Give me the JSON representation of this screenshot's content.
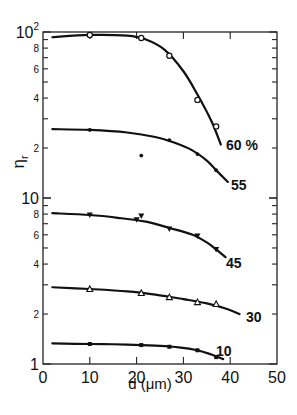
{
  "chart_data": {
    "type": "line",
    "title": "",
    "xlabel": "d (μm)",
    "ylabel": "ηr",
    "xlim": [
      0,
      50
    ],
    "ylim": [
      1,
      100
    ],
    "yscale": "log",
    "grid": false,
    "legend": "inline labels at curve ends",
    "x_ticks": [
      0,
      10,
      20,
      30,
      40,
      50
    ],
    "y_tick_labels": [
      {
        "value": 1,
        "label": "1"
      },
      {
        "value": 2,
        "label": "2"
      },
      {
        "value": 4,
        "label": "4"
      },
      {
        "value": 6,
        "label": "6"
      },
      {
        "value": 8,
        "label": "8"
      },
      {
        "value": 10,
        "label": "10"
      },
      {
        "value": 20,
        "label": "2"
      },
      {
        "value": 40,
        "label": "4"
      },
      {
        "value": 60,
        "label": "6"
      },
      {
        "value": 80,
        "label": "8"
      },
      {
        "value": 100,
        "label": "10²"
      }
    ],
    "series": [
      {
        "name": "60 %",
        "marker": "open-circle",
        "points": [
          [
            10,
            96
          ],
          [
            21,
            92
          ],
          [
            27,
            72
          ],
          [
            33,
            39
          ],
          [
            37,
            27
          ]
        ],
        "curve": [
          [
            2,
            93
          ],
          [
            10,
            96
          ],
          [
            18,
            95
          ],
          [
            22,
            90
          ],
          [
            26,
            78
          ],
          [
            30,
            58
          ],
          [
            33,
            42
          ],
          [
            36,
            29
          ],
          [
            38,
            21
          ]
        ]
      },
      {
        "name": "55",
        "marker": "filled-circle",
        "points": [
          [
            10,
            25.7
          ],
          [
            21,
            18
          ],
          [
            27,
            22.3
          ],
          [
            33,
            18.4
          ],
          [
            37,
            14.7
          ]
        ],
        "curve": [
          [
            2,
            26
          ],
          [
            10,
            25.7
          ],
          [
            18,
            24.8
          ],
          [
            24,
            23.3
          ],
          [
            28,
            21.6
          ],
          [
            32,
            19.3
          ],
          [
            35,
            16.8
          ],
          [
            37,
            14.7
          ],
          [
            39.5,
            12.5
          ]
        ]
      },
      {
        "name": "45",
        "marker": "filled-down-triangle",
        "points": [
          [
            10,
            7.9
          ],
          [
            21,
            7.8
          ],
          [
            20,
            7.4
          ],
          [
            27,
            6.5
          ],
          [
            33,
            5.9
          ],
          [
            37,
            4.9
          ]
        ],
        "curve": [
          [
            2,
            8.1
          ],
          [
            10,
            7.9
          ],
          [
            16,
            7.6
          ],
          [
            22,
            7.2
          ],
          [
            27,
            6.6
          ],
          [
            32,
            6.0
          ],
          [
            35,
            5.4
          ],
          [
            37,
            4.9
          ],
          [
            39,
            4.4
          ]
        ]
      },
      {
        "name": "30",
        "marker": "open-triangle",
        "points": [
          [
            10,
            2.83
          ],
          [
            21,
            2.68
          ],
          [
            27,
            2.53
          ],
          [
            33,
            2.36
          ],
          [
            37,
            2.3
          ]
        ],
        "curve": [
          [
            2,
            2.9
          ],
          [
            10,
            2.83
          ],
          [
            18,
            2.74
          ],
          [
            24,
            2.62
          ],
          [
            30,
            2.46
          ],
          [
            35,
            2.32
          ],
          [
            39,
            2.16
          ],
          [
            42,
            2.0
          ]
        ]
      },
      {
        "name": "10",
        "marker": "filled-square",
        "points": [
          [
            10,
            1.32
          ],
          [
            21,
            1.3
          ],
          [
            27,
            1.27
          ],
          [
            33,
            1.21
          ],
          [
            37,
            1.1
          ]
        ],
        "curve": [
          [
            2,
            1.33
          ],
          [
            10,
            1.32
          ],
          [
            18,
            1.31
          ],
          [
            24,
            1.29
          ],
          [
            29,
            1.26
          ],
          [
            33,
            1.21
          ],
          [
            36,
            1.14
          ],
          [
            38.5,
            1.07
          ]
        ],
        "dashed_tail": true
      }
    ]
  }
}
